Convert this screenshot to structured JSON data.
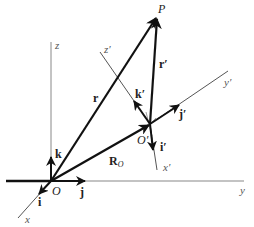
{
  "diagram": {
    "colors": {
      "axis": "#888888",
      "vector": "#111111",
      "background": "#ffffff"
    },
    "points": {
      "P": {
        "label": "P"
      },
      "O": {
        "label": "O"
      },
      "O_prime": {
        "label": "O′"
      }
    },
    "axes": {
      "fixed": {
        "x": "x",
        "y": "y",
        "z": "z"
      },
      "moving": {
        "x": "x′",
        "y": "y′",
        "z": "z′"
      }
    },
    "unit_vectors": {
      "fixed": {
        "i": "i",
        "j": "j",
        "k": "k"
      },
      "moving": {
        "i": "i′",
        "j": "j′",
        "k": "k′"
      }
    },
    "position_vectors": {
      "r": "r",
      "r_prime": "r′",
      "R_o": "R",
      "R_o_sub": "O"
    }
  }
}
